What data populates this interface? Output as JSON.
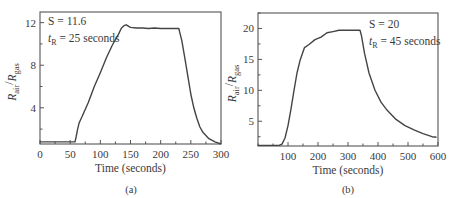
{
  "chart_data": [
    {
      "type": "line",
      "panel_label": "(a)",
      "title": "",
      "xlabel": "Time (seconds)",
      "ylabel": "R_air/R_gas",
      "ylabel_parts": {
        "main1": "R",
        "sub1": "air",
        "sep": "/",
        "main2": "R",
        "sub2": "gas"
      },
      "xlim": [
        0,
        300
      ],
      "ylim": [
        0.6,
        13
      ],
      "xticks": [
        0,
        50,
        100,
        150,
        200,
        250,
        300
      ],
      "yticks": [
        4,
        8,
        12
      ],
      "grid": false,
      "annotations": {
        "line1": "S = 11.6",
        "line2_main": "t",
        "line2_sub": "R",
        "line2_rest": " = 25 seconds"
      },
      "series": [
        {
          "name": "response",
          "x": [
            0,
            20,
            40,
            58,
            60,
            62,
            65,
            70,
            80,
            90,
            100,
            110,
            120,
            130,
            135,
            140,
            143,
            147,
            150,
            160,
            170,
            180,
            190,
            200,
            210,
            220,
            230,
            232,
            235,
            240,
            245,
            250,
            255,
            260,
            265,
            270,
            280,
            290,
            300
          ],
          "y": [
            0.8,
            0.8,
            0.8,
            0.8,
            1.3,
            1.9,
            2.6,
            3.2,
            4.5,
            6.0,
            7.3,
            8.7,
            9.9,
            10.9,
            11.5,
            11.75,
            11.8,
            11.65,
            11.55,
            11.5,
            11.5,
            11.45,
            11.5,
            11.45,
            11.45,
            11.45,
            11.45,
            11.0,
            10.3,
            8.7,
            7.0,
            5.3,
            4.0,
            3.0,
            2.2,
            1.7,
            1.1,
            0.8,
            0.6
          ]
        }
      ]
    },
    {
      "type": "line",
      "panel_label": "(b)",
      "title": "",
      "xlabel": "Time (seconds)",
      "ylabel": "R_air/R_gas",
      "ylabel_parts": {
        "main1": "R",
        "sub1": "air",
        "sep": "/",
        "main2": "R",
        "sub2": "gas"
      },
      "xlim": [
        0,
        600
      ],
      "ylim": [
        1,
        22.5
      ],
      "xticks": [
        100,
        200,
        300,
        400,
        500,
        600
      ],
      "yticks": [
        5,
        10,
        15,
        20
      ],
      "grid": false,
      "annotations": {
        "line1": "S = 20",
        "line2_main": "t",
        "line2_sub": "R",
        "line2_rest": " = 45 seconds"
      },
      "series": [
        {
          "name": "response",
          "x": [
            0,
            40,
            70,
            80,
            90,
            100,
            110,
            120,
            130,
            140,
            155,
            170,
            190,
            210,
            230,
            250,
            270,
            300,
            320,
            340,
            345,
            355,
            370,
            390,
            410,
            430,
            460,
            490,
            520,
            550,
            580,
            595
          ],
          "y": [
            1.1,
            1.1,
            1.1,
            1.3,
            2.3,
            4.3,
            7.0,
            10.0,
            12.8,
            14.8,
            16.9,
            17.4,
            18.2,
            18.6,
            19.3,
            19.5,
            19.7,
            19.7,
            19.7,
            19.7,
            18.8,
            16.0,
            12.8,
            10.0,
            8.1,
            6.8,
            5.3,
            4.3,
            3.6,
            3.0,
            2.5,
            2.4
          ]
        }
      ]
    }
  ]
}
